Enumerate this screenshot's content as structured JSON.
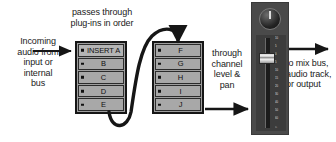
{
  "diagram": {
    "labels": {
      "incoming": "Incoming\naudio from\ninput or\ninternal\nbus",
      "passes_through": "passes through\nplug-ins in order",
      "through_channel": "through\nchannel\nlevel &\npan",
      "output": "to mix bus,\naudio track,\nor output"
    },
    "rack_a": {
      "name": "insert-rack-a",
      "slots": [
        {
          "label": "INSERT A"
        },
        {
          "label": "B"
        },
        {
          "label": "C"
        },
        {
          "label": "D"
        },
        {
          "label": "E"
        }
      ]
    },
    "rack_b": {
      "name": "insert-rack-b",
      "slots": [
        {
          "label": "F"
        },
        {
          "label": "G"
        },
        {
          "label": "H"
        },
        {
          "label": "I"
        },
        {
          "label": "J"
        }
      ]
    },
    "channel_strip": {
      "knob": "pan-knob",
      "fader": "channel-fader",
      "scale_ticks": [
        "10",
        "5",
        "0",
        "5",
        "10",
        "15",
        "20",
        "30",
        "40",
        "50",
        "60",
        "∞"
      ]
    },
    "colors": {
      "ink": "#1a1a1a",
      "slot_fill": "#a8a8a8",
      "rack_border": "#161616",
      "strip_body": "#4a4a4a",
      "fader_cap": "#e4e4e4"
    }
  }
}
